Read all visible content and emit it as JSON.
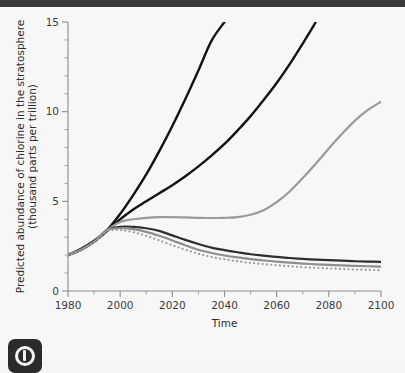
{
  "figure": {
    "background_color": "#f7f7f7",
    "topbar_color": "#3a3a3c",
    "watermark_name": "copyright-badge-icon"
  },
  "chart_data": {
    "type": "line",
    "title": "",
    "subtitle": "",
    "xlabel": "Time",
    "ylabel": "Predicted abundance of chlorine in the stratosphere (thousand parts per trillion)",
    "ylabel_line1": "Predicted abundance of chlorine in the stratosphere",
    "ylabel_line2": "(thousand parts per trillion)",
    "xlim": [
      1980,
      2100
    ],
    "ylim": [
      0,
      15
    ],
    "x_major_ticks": [
      1980,
      2000,
      2020,
      2040,
      2060,
      2080,
      2100
    ],
    "x_minor_step": 10,
    "y_major_ticks": [
      0,
      5,
      10,
      15
    ],
    "y_minor_step": 1,
    "x_tick_labels": [
      "1980",
      "2000",
      "2020",
      "2040",
      "2060",
      "2080",
      "2100"
    ],
    "y_tick_labels": [
      "0",
      "5",
      "10",
      "15"
    ],
    "grid": false,
    "legend": "none",
    "x": [
      1980,
      1985,
      1990,
      1995,
      2000,
      2005,
      2010,
      2015,
      2020,
      2025,
      2030,
      2035,
      2040,
      2045,
      2050,
      2055,
      2060,
      2065,
      2070,
      2075,
      2080,
      2085,
      2090,
      2095,
      2100
    ],
    "series": [
      {
        "name": "no-protocol",
        "color": "#121212",
        "width": 2.4,
        "dash": "solid",
        "clipped_at_top": true,
        "exit_year": 2042,
        "values": [
          2.0,
          2.35,
          2.8,
          3.4,
          4.3,
          5.35,
          6.5,
          7.8,
          9.2,
          10.7,
          12.3,
          13.95,
          15.0,
          null,
          null,
          null,
          null,
          null,
          null,
          null,
          null,
          null,
          null,
          null,
          null
        ]
      },
      {
        "name": "montreal-1987",
        "color": "#121212",
        "width": 2.4,
        "dash": "solid",
        "clipped_at_top": true,
        "exit_year": 2075,
        "values": [
          2.0,
          2.3,
          2.75,
          3.35,
          4.0,
          4.55,
          5.0,
          5.45,
          5.9,
          6.4,
          6.95,
          7.55,
          8.2,
          8.95,
          9.75,
          10.65,
          11.6,
          12.65,
          13.8,
          15.0,
          null,
          null,
          null,
          null,
          null
        ]
      },
      {
        "name": "london-1990",
        "color": "#9a9a9a",
        "width": 2.2,
        "dash": "solid",
        "clipped_at_top": false,
        "values": [
          2.0,
          2.3,
          2.75,
          3.4,
          3.85,
          4.0,
          4.08,
          4.12,
          4.12,
          4.1,
          4.08,
          4.07,
          4.08,
          4.12,
          4.25,
          4.5,
          4.95,
          5.55,
          6.3,
          7.1,
          7.95,
          8.75,
          9.5,
          10.1,
          10.55
        ]
      },
      {
        "name": "copenhagen-1992",
        "color": "#2d2d33",
        "width": 2.2,
        "dash": "solid",
        "clipped_at_top": false,
        "values": [
          2.0,
          2.3,
          2.75,
          3.4,
          3.58,
          3.58,
          3.5,
          3.35,
          3.1,
          2.85,
          2.62,
          2.42,
          2.28,
          2.16,
          2.05,
          1.97,
          1.9,
          1.84,
          1.79,
          1.75,
          1.72,
          1.69,
          1.66,
          1.64,
          1.62
        ]
      },
      {
        "name": "zero-emissions",
        "color": "#8e8e8e",
        "width": 2.2,
        "dash": "solid",
        "clipped_at_top": false,
        "values": [
          2.0,
          2.3,
          2.75,
          3.4,
          3.5,
          3.45,
          3.3,
          3.08,
          2.82,
          2.55,
          2.3,
          2.12,
          1.98,
          1.87,
          1.78,
          1.7,
          1.64,
          1.58,
          1.53,
          1.49,
          1.46,
          1.43,
          1.4,
          1.38,
          1.36
        ]
      },
      {
        "name": "natural-level",
        "color": "#9c9c9c",
        "width": 2.2,
        "dash": "dotted",
        "clipped_at_top": false,
        "values": [
          2.0,
          2.3,
          2.72,
          3.32,
          3.4,
          3.28,
          3.08,
          2.82,
          2.55,
          2.3,
          2.08,
          1.9,
          1.77,
          1.66,
          1.57,
          1.5,
          1.44,
          1.38,
          1.33,
          1.29,
          1.26,
          1.23,
          1.2,
          1.18,
          1.16
        ]
      }
    ]
  }
}
